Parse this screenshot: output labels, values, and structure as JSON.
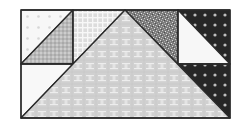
{
  "diagram": {
    "type": "quilt-block",
    "colors": {
      "background": "#ffffff",
      "outline": "#2a2a2a",
      "center_fill": "#d2d2d2",
      "center_motif": "#f0f0f0",
      "plaid_fill": "#e4e4e4",
      "plaid_line": "#f8f8f8",
      "check_fill": "#b8b8b8",
      "speckle_fill": "#8a8a8a",
      "dark_fill": "#262626",
      "dark_dot": "#bdbdbd",
      "light_fill": "#f7f7f7",
      "light_dot": "#d8d8d8"
    },
    "pieces": [
      {
        "id": "top-left-upper",
        "shape": "triangle",
        "fabric": "white-dotted"
      },
      {
        "id": "top-left-lower",
        "shape": "triangle",
        "fabric": "gray-check"
      },
      {
        "id": "top-mid-left",
        "shape": "triangle",
        "fabric": "light-plaid"
      },
      {
        "id": "top-mid-right",
        "shape": "triangle",
        "fabric": "dark-speckle"
      },
      {
        "id": "top-right-upper",
        "shape": "triangle",
        "fabric": "black-dotted"
      },
      {
        "id": "top-right-lower",
        "shape": "triangle",
        "fabric": "white-plain"
      },
      {
        "id": "bottom-left",
        "shape": "triangle",
        "fabric": "white-plain"
      },
      {
        "id": "bottom-right",
        "shape": "triangle",
        "fabric": "black-dotted"
      },
      {
        "id": "center",
        "shape": "triangle",
        "fabric": "gray-x-motif"
      }
    ]
  }
}
